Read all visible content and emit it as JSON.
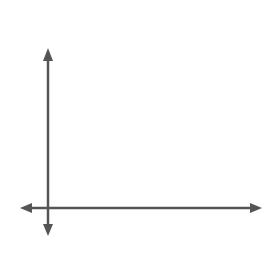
{
  "option_label": "D.",
  "axes": {
    "x_label": "x",
    "y_label": "y",
    "origin_label": "O"
  },
  "grid": {
    "cols": 9,
    "rows": 7,
    "unit_px": 27,
    "line_color": "#8a8a8a",
    "axis_color": "#555555"
  },
  "figure": {
    "stroke_color": "#111111",
    "points": [
      {
        "x": 2,
        "y": 6
      },
      {
        "x": 4,
        "y": 6
      },
      {
        "x": 2,
        "y": 4
      },
      {
        "x": 4,
        "y": 4
      },
      {
        "x": 2,
        "y": 3
      },
      {
        "x": 4,
        "y": 3
      },
      {
        "x": 2,
        "y": 1
      },
      {
        "x": 4,
        "y": 1
      }
    ],
    "segments": [
      [
        [
          2,
          6
        ],
        [
          4,
          6
        ]
      ],
      [
        [
          4,
          6
        ],
        [
          2,
          4
        ]
      ],
      [
        [
          2,
          4
        ],
        [
          4,
          4
        ]
      ],
      [
        [
          2,
          3
        ],
        [
          4,
          3
        ]
      ],
      [
        [
          2,
          3
        ],
        [
          4,
          1
        ]
      ],
      [
        [
          2,
          1
        ],
        [
          4,
          1
        ]
      ]
    ]
  }
}
